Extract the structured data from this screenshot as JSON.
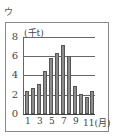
{
  "panel_label": "ウ",
  "chart_data": {
    "type": "bar",
    "title": "",
    "xlabel": "(月)",
    "ylabel": "(千t)",
    "categories": [
      "1",
      "2",
      "3",
      "4",
      "5",
      "6",
      "7",
      "8",
      "9",
      "10",
      "11",
      "12"
    ],
    "values": [
      2.4,
      2.7,
      3.1,
      4.5,
      5.8,
      6.3,
      7.2,
      6.0,
      2.9,
      2.1,
      1.8,
      2.4
    ],
    "ylim": [
      0,
      8
    ],
    "yticks": [
      "0",
      "2",
      "4",
      "6",
      "8"
    ],
    "xtick_labels": [
      "1",
      "3",
      "5",
      "7",
      "9",
      "11(月)"
    ],
    "grid": true,
    "bar_color": "#8c8c8c"
  }
}
